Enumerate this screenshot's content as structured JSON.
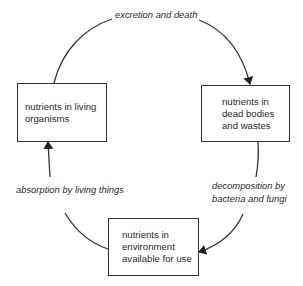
{
  "diagram": {
    "type": "cycle",
    "title": "",
    "nodes": [
      {
        "id": "living",
        "label": "nutrients in living\norganisms"
      },
      {
        "id": "dead",
        "label": "nutrients in\ndead bodies\nand wastes"
      },
      {
        "id": "environment",
        "label": "nutrients in\nenvironment\navailable for use"
      }
    ],
    "edges": [
      {
        "from": "living",
        "to": "dead",
        "label": "excretion and death"
      },
      {
        "from": "dead",
        "to": "environment",
        "label": "decomposition by\nbacteria and fungi"
      },
      {
        "from": "environment",
        "to": "living",
        "label": "absorption by living things"
      }
    ],
    "colors": {
      "stroke": "#333333",
      "text": "#2a2a2a",
      "background": "#ffffff"
    }
  }
}
